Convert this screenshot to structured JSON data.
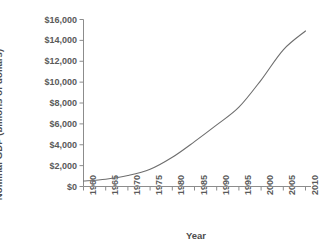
{
  "chart_data": {
    "type": "line",
    "title": "",
    "xlabel": "Year",
    "ylabel": "Nominal GDP (billions of dollars)",
    "xlim": [
      1960,
      2010
    ],
    "ylim": [
      0,
      16000
    ],
    "grid": false,
    "legend": null,
    "line_color": "#6e6e6e",
    "x_tick_labels": [
      "1960",
      "1965",
      "1970",
      "1975",
      "1980",
      "1985",
      "1990",
      "1995",
      "2000",
      "2005",
      "2010"
    ],
    "y_tick_labels": [
      "$0",
      "$2,000",
      "$4,000",
      "$6,000",
      "$8,000",
      "$10,000",
      "$12,000",
      "$14,000",
      "$16,000"
    ],
    "y_ticks": [
      0,
      2000,
      4000,
      6000,
      8000,
      10000,
      12000,
      14000,
      16000
    ],
    "x": [
      1960,
      1965,
      1970,
      1975,
      1980,
      1985,
      1990,
      1995,
      2000,
      2005,
      2010
    ],
    "values": [
      520,
      700,
      1050,
      1650,
      2800,
      4300,
      5900,
      7600,
      10200,
      13100,
      14900
    ],
    "series": [
      {
        "name": "Nominal GDP",
        "values": [
          520,
          700,
          1050,
          1650,
          2800,
          4300,
          5900,
          7600,
          10200,
          13100,
          14900
        ]
      }
    ]
  },
  "axes": {
    "y_title": "Nominal GDP (billions of dollars)",
    "x_title": "Year"
  },
  "colors": {
    "line": "#6e6e6e",
    "axis": "#8c8c8c",
    "text": "#5a5a5a",
    "background": "#ffffff"
  }
}
